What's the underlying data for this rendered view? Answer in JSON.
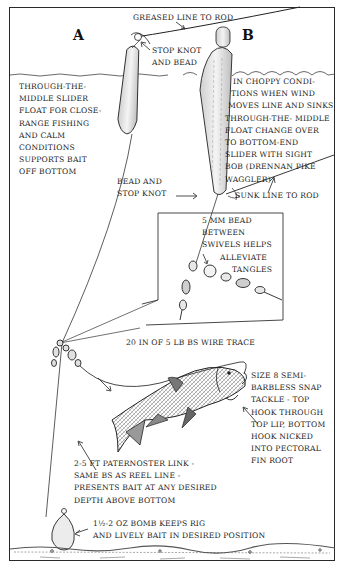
{
  "diagram": {
    "type": "fishing-rig-illustration",
    "panels": {
      "a": "A",
      "b": "B"
    },
    "labels": {
      "greased_line": "GREASED LINE TO ROD",
      "stop_knot_bead": [
        "STOP KNOT",
        "AND BEAD"
      ],
      "float_a_desc": [
        "THROUGH-THE-",
        "MIDDLE SLIDER",
        "FLOAT FOR CLOSE-",
        "RANGE FISHING",
        "AND CALM",
        "CONDITIONS",
        "SUPPORTS BAIT",
        "OFF BOTTOM"
      ],
      "float_b_desc": [
        "IN CHOPPY CONDI-",
        "TIONS WHEN WIND",
        "MOVES LINE AND SINKS",
        "THROUGH-THE- MIDDLE",
        "FLOAT CHANGE OVER",
        "TO BOTTOM-END",
        "SLIDER WITH SIGHT",
        "BOB (DRENNAN PIKE",
        "WAGGLER)"
      ],
      "bead_stop_knot": [
        "BEAD AND",
        "STOP KNOT"
      ],
      "sunk_line": "SUNK LINE TO ROD",
      "bead_between_swivels": [
        "5 MM BEAD",
        "BETWEEN",
        "SWIVELS HELPS",
        "ALLEVIATE",
        "TANGLES"
      ],
      "wire_trace": "20 IN OF 5 LB BS WIRE TRACE",
      "snap_tackle": [
        "SIZE 8 SEMI-",
        "BARBLESS SNAP",
        "TACKLE - TOP",
        "HOOK THROUGH",
        "TOP LIP, BOTTOM",
        "HOOK NICKED",
        "INTO PECTORAL",
        "FIN ROOT"
      ],
      "paternoster_link": [
        "2-5 FT PATERNOSTER LINK -",
        "SAME BS AS REEL LINE -",
        "PRESENTS BAIT AT ANY DESIRED",
        "DEPTH ABOVE BOTTOM"
      ],
      "bomb": [
        "1½-2 OZ BOMB KEEPS RIG",
        "AND LIVELY BAIT IN DESIRED  POSITION"
      ]
    },
    "colors": {
      "ink": "#1f1f1f",
      "paper": "#ffffff",
      "float_shade": "#d8d8d8"
    }
  }
}
